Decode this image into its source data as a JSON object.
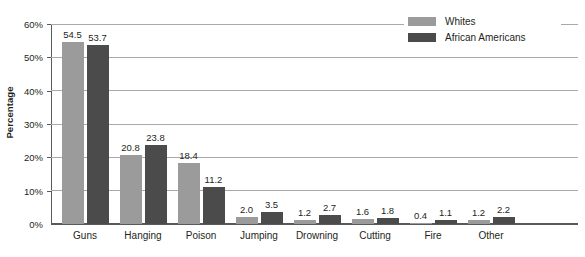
{
  "chart_data": {
    "type": "bar",
    "title": "",
    "xlabel": "",
    "ylabel": "Percentage",
    "ylim": [
      0,
      60
    ],
    "ytick_values": [
      0,
      10,
      20,
      30,
      40,
      50,
      60
    ],
    "ytick_labels": [
      "0%",
      "10%",
      "20%",
      "30%",
      "40%",
      "50%",
      "60%"
    ],
    "grid": true,
    "legend_position": "top-right",
    "categories": [
      "Guns",
      "Hanging",
      "Poison",
      "Jumping",
      "Drowning",
      "Cutting",
      "Fire",
      "Other"
    ],
    "series": [
      {
        "name": "Whites",
        "color": "#9b9b9b",
        "values": [
          54.5,
          20.8,
          18.4,
          2.0,
          1.2,
          1.6,
          0.4,
          1.2
        ],
        "labels": [
          "54.5",
          "20.8",
          "18.4",
          "2.0",
          "1.2",
          "1.6",
          "0.4",
          "1.2"
        ]
      },
      {
        "name": "African Americans",
        "color": "#4b4b4b",
        "values": [
          53.7,
          23.8,
          11.2,
          3.5,
          2.7,
          1.8,
          1.1,
          2.2
        ],
        "labels": [
          "53.7",
          "23.8",
          "11.2",
          "3.5",
          "2.7",
          "1.8",
          "1.1",
          "2.2"
        ]
      }
    ]
  },
  "legend": {
    "items": [
      {
        "label": "Whites",
        "color": "#9b9b9b"
      },
      {
        "label": "African Americans",
        "color": "#4b4b4b"
      }
    ]
  },
  "axis": {
    "y_title": "Percentage"
  }
}
